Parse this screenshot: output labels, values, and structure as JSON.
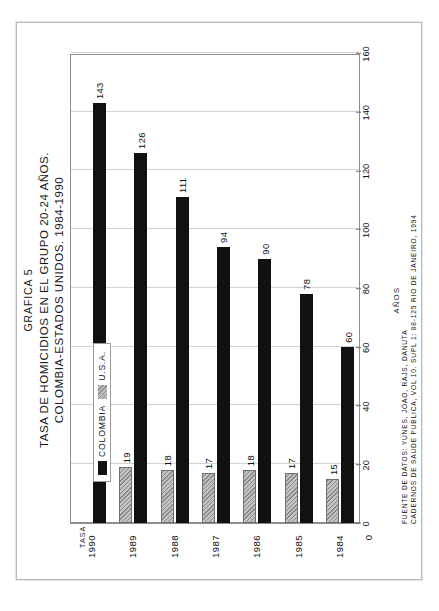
{
  "figure": {
    "graphic_number": "GRAFICA 5",
    "title_line1": "TASA DE HOMICIDIOS EN EL GRUPO 20-24 AÑOS.",
    "title_line2": "COLOMBIA-ESTADOS UNIDOS. 1984-1990",
    "y_axis_title": "TASA POR 100.000 HABITANTES",
    "x_axis_title": "AÑOS",
    "source_line1": "FUENTE DE DATOS: YUNES, JOAO, RAJS, DANUTA",
    "source_line2": "CADERNOS DE SAUDE PUBLICA, VOL 10. SUPL 1: 88-125 RIO DE JANEIRO, 1994"
  },
  "legend": {
    "items": [
      {
        "label": "COLOMBIA",
        "color": "#111111",
        "style": "solid"
      },
      {
        "label": "U.S.A.",
        "color": "#c2c2c2",
        "style": "hatched"
      }
    ]
  },
  "colors": {
    "colombia": "#111111",
    "usa": "#c2c2c2",
    "usa_hatch": "#8a8a8a",
    "grid": "#d2d2d2",
    "axis": "#8d8d8d",
    "text": "#111111",
    "page_border": "#b9b9b9"
  },
  "chart_data": {
    "type": "bar",
    "orientation": "horizontal",
    "xlabel": "AÑOS",
    "ylabel": "TASA POR 100.000 HABITANTES",
    "categories": [
      "1984",
      "1985",
      "1986",
      "1987",
      "1988",
      "1989",
      "1990"
    ],
    "series": [
      {
        "name": "COLOMBIA",
        "values": [
          60,
          78,
          90,
          94,
          111,
          126,
          143
        ]
      },
      {
        "name": "U.S.A.",
        "values": [
          15,
          17,
          18,
          17,
          18,
          19,
          null
        ]
      }
    ],
    "value_ticks": [
      0,
      20,
      40,
      60,
      80,
      100,
      120,
      140,
      160
    ],
    "value_axis_origin_label": "0",
    "ylim": [
      0,
      160
    ],
    "grid": true,
    "legend_position": "inside-left",
    "data_labels": true
  }
}
